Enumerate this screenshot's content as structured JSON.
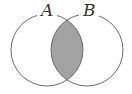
{
  "diagram": {
    "type": "venn",
    "sets": [
      {
        "label": "A",
        "cx": 47,
        "cy": 50,
        "r": 36
      },
      {
        "label": "B",
        "cx": 87,
        "cy": 50,
        "r": 36
      }
    ],
    "shaded_region": "A ∩ B",
    "colors": {
      "outline": "#6a6a6a",
      "shade": "#a2a2a2",
      "background": "#ffffff"
    }
  }
}
